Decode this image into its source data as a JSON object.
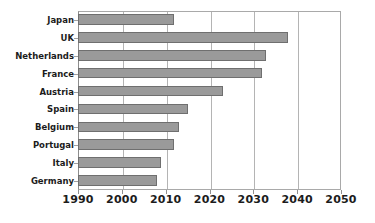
{
  "chart_data": {
    "type": "bar",
    "orientation": "horizontal",
    "title": "",
    "subtitle": "",
    "xlabel": "",
    "ylabel": "",
    "categories": [
      "Japan",
      "UK",
      "Netherlands",
      "France",
      "Austria",
      "Spain",
      "Belgium",
      "Portugal",
      "Italy",
      "Germany"
    ],
    "values": [
      2012,
      2038,
      2033,
      2032,
      2023,
      2015,
      2013,
      2012,
      2009,
      2008
    ],
    "bar_start": 1990,
    "xlim": [
      1990,
      2050
    ],
    "xticks": [
      1990,
      2000,
      2010,
      2020,
      2030,
      2040,
      2050
    ],
    "xtick_labels": [
      "1990",
      "2000",
      "2010",
      "2020",
      "2030",
      "2040",
      "2050"
    ],
    "grid": true,
    "grid_axis": "x",
    "legend": false,
    "bar_color": "#9a9a9a",
    "bar_edge_color": "#6f6f6f",
    "grid_color": "#b4b4b4",
    "axis_color": "#8c8c8c",
    "background_color": "#ffffff",
    "label_color": "#1c1c1c"
  }
}
